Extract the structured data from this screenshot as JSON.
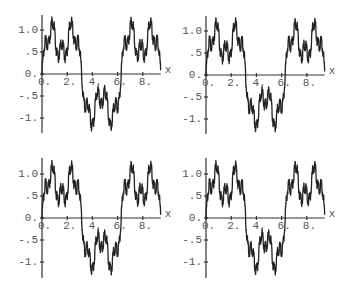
{
  "chart_data": [
    {
      "type": "line",
      "panel": "top-left",
      "title": "",
      "xlabel": "x",
      "ylabel": "",
      "xlim": [
        0,
        9.42
      ],
      "ylim": [
        -1.35,
        1.35
      ],
      "grid": false,
      "legend": null,
      "x_ticks": [
        0,
        2,
        4,
        6,
        8
      ],
      "x_tick_labels": [
        "0.",
        "2.",
        "4.",
        "6.",
        "8."
      ],
      "y_ticks": [
        1.0,
        0.5,
        0.0,
        -0.5,
        -1.0
      ],
      "y_tick_labels": [
        "1.0",
        ".5",
        "0.",
        "-.5",
        "-1."
      ],
      "function": {
        "form": "sum a^k sin(b^k x)",
        "a": 0.5,
        "b": 3,
        "terms": 6
      },
      "series": [
        {
          "name": "f(x)",
          "key_points": {
            "x": [
              0,
              0.87,
              1.57,
              2.27,
              3.14,
              4.01,
              4.71,
              5.41,
              6.28,
              7.15,
              7.85,
              8.55,
              9.42
            ],
            "y": [
              0.5,
              1.35,
              0.45,
              1.35,
              0,
              -1.35,
              -0.45,
              -1.35,
              0,
              1.35,
              0.45,
              1.35,
              0
            ]
          }
        }
      ]
    },
    {
      "type": "line",
      "panel": "top-right",
      "title": "",
      "xlabel": "x",
      "ylabel": "",
      "xlim": [
        0,
        9.42
      ],
      "ylim": [
        -1.35,
        1.35
      ],
      "grid": false,
      "legend": null,
      "x_ticks": [
        0,
        2,
        4,
        6,
        8
      ],
      "x_tick_labels": [
        "0.",
        "2.",
        "4.",
        "6.",
        "8."
      ],
      "y_ticks": [
        1.0,
        0.5,
        0.0,
        -0.5,
        -1.0
      ],
      "y_tick_labels": [
        "1.0",
        ".5",
        "0.",
        "-.5",
        "-1."
      ],
      "function": {
        "form": "sum a^k sin(b^k x)",
        "a": 0.5,
        "b": 3,
        "terms": 7
      },
      "series": [
        {
          "name": "f(x)",
          "key_points": {
            "x": [
              0,
              0.87,
              1.57,
              2.27,
              3.14,
              4.01,
              4.71,
              5.41,
              6.28,
              7.15,
              7.85,
              8.55,
              9.42
            ],
            "y": [
              0.5,
              1.35,
              0.45,
              1.35,
              0,
              -1.35,
              -0.45,
              -1.35,
              0,
              1.35,
              0.45,
              1.35,
              0
            ]
          }
        }
      ]
    },
    {
      "type": "line",
      "panel": "bottom-left",
      "title": "",
      "xlabel": "x",
      "ylabel": "",
      "xlim": [
        0,
        9.42
      ],
      "ylim": [
        -1.35,
        1.35
      ],
      "grid": false,
      "legend": null,
      "x_ticks": [
        0,
        2,
        4,
        6,
        8
      ],
      "x_tick_labels": [
        "0.",
        "2.",
        "4.",
        "6.",
        "8."
      ],
      "y_ticks": [
        1.0,
        0.5,
        0.0,
        -0.5,
        -1.0
      ],
      "y_tick_labels": [
        "1.0",
        ".5",
        "0.",
        "-.5",
        "-1."
      ],
      "function": {
        "form": "sum a^k sin(b^k x)",
        "a": 0.5,
        "b": 3,
        "terms": 8
      },
      "series": [
        {
          "name": "f(x)",
          "key_points": {
            "x": [
              0,
              0.87,
              1.57,
              2.27,
              3.14,
              4.01,
              4.71,
              5.41,
              6.28,
              7.15,
              7.85,
              8.55,
              9.42
            ],
            "y": [
              0.5,
              1.35,
              0.45,
              1.35,
              0,
              -1.35,
              -0.45,
              -1.35,
              0,
              1.35,
              0.45,
              1.35,
              0
            ]
          }
        }
      ]
    },
    {
      "type": "line",
      "panel": "bottom-right",
      "title": "",
      "xlabel": "x",
      "ylabel": "",
      "xlim": [
        0,
        9.42
      ],
      "ylim": [
        -1.35,
        1.35
      ],
      "grid": false,
      "legend": null,
      "x_ticks": [
        0,
        2,
        4,
        6,
        8
      ],
      "x_tick_labels": [
        "0.",
        "2.",
        "4.",
        "6.",
        "8."
      ],
      "y_ticks": [
        1.0,
        0.5,
        0.0,
        -0.5,
        -1.0
      ],
      "y_tick_labels": [
        "1.0",
        ".5",
        "0.",
        "-.5",
        "-1."
      ],
      "function": {
        "form": "sum a^k sin(b^k x)",
        "a": 0.5,
        "b": 3,
        "terms": 9
      },
      "series": [
        {
          "name": "f(x)",
          "key_points": {
            "x": [
              0,
              0.87,
              1.57,
              2.27,
              3.14,
              4.01,
              4.71,
              5.41,
              6.28,
              7.15,
              7.85,
              8.55,
              9.42
            ],
            "y": [
              0.5,
              1.35,
              0.45,
              1.35,
              0,
              -1.35,
              -0.45,
              -1.35,
              0,
              1.35,
              0.45,
              1.35,
              0
            ]
          }
        }
      ]
    }
  ],
  "layout": {
    "panels": [
      {
        "origin_px": [
          42,
          74
        ],
        "x_px_per_unit": 12.6,
        "y_px_per_unit": 44,
        "y_top_px": 15,
        "y_bottom_px": 133
      },
      {
        "origin_px": [
          206,
          75
        ],
        "x_px_per_unit": 12.6,
        "y_px_per_unit": 44,
        "y_top_px": 16,
        "y_bottom_px": 134
      },
      {
        "origin_px": [
          42,
          218
        ],
        "x_px_per_unit": 12.6,
        "y_px_per_unit": 44,
        "y_top_px": 158,
        "y_bottom_px": 278
      },
      {
        "origin_px": [
          206,
          218
        ],
        "x_px_per_unit": 12.6,
        "y_px_per_unit": 44,
        "y_top_px": 158,
        "y_bottom_px": 278
      }
    ],
    "colors": {
      "curve": "#222222",
      "axis": "#333333",
      "label": "#555555",
      "background": "#ffffff"
    }
  }
}
